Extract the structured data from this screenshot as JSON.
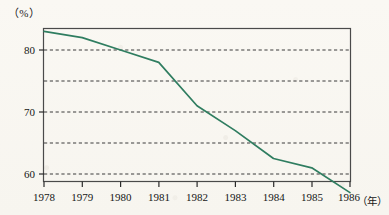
{
  "figure": {
    "unit_label": "（%）",
    "x_axis_unit": "（年）",
    "line_color": "#2f7d60",
    "frame_color": "#4a4a4a",
    "gridline_color": "#3a3a3a",
    "background_color": "#fbfaf7",
    "text_color": "#161616"
  },
  "chart_data": {
    "type": "line",
    "title": "",
    "xlabel": "年",
    "ylabel": "%",
    "x": [
      1978,
      1979,
      1980,
      1981,
      1982,
      1983,
      1984,
      1985,
      1986
    ],
    "values": [
      83.0,
      82.0,
      80.0,
      78.0,
      71.0,
      67.0,
      62.5,
      61.0,
      57.0
    ],
    "categories": [
      "1978",
      "1979",
      "1980",
      "1981",
      "1982",
      "1983",
      "1984",
      "1985",
      "1986"
    ],
    "xlim": [
      1978,
      1986
    ],
    "ylim": [
      54.5,
      85.0
    ],
    "ytick_labels": [
      "80",
      "70",
      "60"
    ],
    "ytick_values": [
      80,
      70,
      60
    ],
    "gridline_values": [
      80,
      75,
      70,
      65,
      60
    ],
    "grid": true,
    "grid_style": "dashed",
    "legend": false,
    "series": [
      {
        "name": "",
        "values": [
          83.0,
          82.0,
          80.0,
          78.0,
          71.0,
          67.0,
          62.5,
          61.0,
          57.0
        ]
      }
    ]
  },
  "x_ticks": [
    {
      "label": "1978"
    },
    {
      "label": "1979"
    },
    {
      "label": "1980"
    },
    {
      "label": "1981"
    },
    {
      "label": "1982"
    },
    {
      "label": "1983"
    },
    {
      "label": "1984"
    },
    {
      "label": "1985"
    },
    {
      "label": "1986"
    }
  ],
  "y_ticks": [
    {
      "label": "80"
    },
    {
      "label": "70"
    },
    {
      "label": "60"
    }
  ]
}
